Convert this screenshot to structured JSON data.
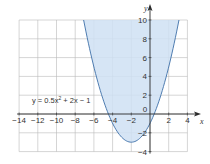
{
  "chart_data": {
    "type": "area",
    "title": "",
    "xlabel": "x",
    "ylabel": "y",
    "xlim": [
      -14,
      6
    ],
    "ylim": [
      -4,
      10
    ],
    "grid": true,
    "x_ticks": [
      -14,
      -12,
      -10,
      -8,
      -6,
      -4,
      -2,
      0,
      2,
      4
    ],
    "y_ticks": [
      -4,
      -2,
      2,
      4,
      6,
      8,
      10
    ],
    "x_tick_labels": [
      "−14",
      "−12",
      "−10",
      "−8",
      "−6",
      "−4",
      "−2",
      "0",
      "2",
      "4"
    ],
    "y_tick_labels": [
      "−4",
      "−2",
      "2",
      "4",
      "6",
      "8",
      "10"
    ],
    "series": [
      {
        "name": "y = 0.5x² + 2x − 1",
        "equation": {
          "a": 0.5,
          "b": 2,
          "c": -1
        },
        "shaded_region": "y ≥ 0.5x² + 2x − 1",
        "vertex": [
          -2,
          -3
        ],
        "fill_color": "#cfe0f3",
        "line_color": "#3d6fa8"
      }
    ],
    "annotation": {
      "text_prefix": "y = 0.5x",
      "text_sup": "2",
      "text_suffix": " + 2x − 1"
    }
  }
}
